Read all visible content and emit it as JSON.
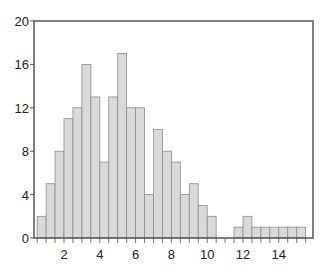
{
  "chart_data": {
    "type": "bar",
    "subtype": "histogram",
    "title": "",
    "xlabel": "",
    "ylabel": "",
    "bin_width": 0.5,
    "bins": [
      {
        "start": 0.5,
        "end": 1.0,
        "count": 2
      },
      {
        "start": 1.0,
        "end": 1.5,
        "count": 5
      },
      {
        "start": 1.5,
        "end": 2.0,
        "count": 8
      },
      {
        "start": 2.0,
        "end": 2.5,
        "count": 11
      },
      {
        "start": 2.5,
        "end": 3.0,
        "count": 12
      },
      {
        "start": 3.0,
        "end": 3.5,
        "count": 16
      },
      {
        "start": 3.5,
        "end": 4.0,
        "count": 13
      },
      {
        "start": 4.0,
        "end": 4.5,
        "count": 7
      },
      {
        "start": 4.5,
        "end": 5.0,
        "count": 13
      },
      {
        "start": 5.0,
        "end": 5.5,
        "count": 17
      },
      {
        "start": 5.5,
        "end": 6.0,
        "count": 12
      },
      {
        "start": 6.0,
        "end": 6.5,
        "count": 12
      },
      {
        "start": 6.5,
        "end": 7.0,
        "count": 4
      },
      {
        "start": 7.0,
        "end": 7.5,
        "count": 10
      },
      {
        "start": 7.5,
        "end": 8.0,
        "count": 8
      },
      {
        "start": 8.0,
        "end": 8.5,
        "count": 7
      },
      {
        "start": 8.5,
        "end": 9.0,
        "count": 4
      },
      {
        "start": 9.0,
        "end": 9.5,
        "count": 5
      },
      {
        "start": 9.5,
        "end": 10.0,
        "count": 3
      },
      {
        "start": 10.0,
        "end": 10.5,
        "count": 2
      },
      {
        "start": 10.5,
        "end": 11.0,
        "count": 0
      },
      {
        "start": 11.0,
        "end": 11.5,
        "count": 0
      },
      {
        "start": 11.5,
        "end": 12.0,
        "count": 1
      },
      {
        "start": 12.0,
        "end": 12.5,
        "count": 2
      },
      {
        "start": 12.5,
        "end": 13.0,
        "count": 1
      },
      {
        "start": 13.0,
        "end": 13.5,
        "count": 1
      },
      {
        "start": 13.5,
        "end": 14.0,
        "count": 1
      },
      {
        "start": 14.0,
        "end": 14.5,
        "count": 1
      },
      {
        "start": 14.5,
        "end": 15.0,
        "count": 1
      },
      {
        "start": 15.0,
        "end": 15.5,
        "count": 1
      }
    ],
    "xlim": [
      0,
      15.7
    ],
    "ylim": [
      0,
      20
    ],
    "x_ticks": [
      2,
      4,
      6,
      8,
      10,
      12,
      14
    ],
    "x_minor_tick_step": 0.5,
    "y_ticks": [
      0,
      4,
      8,
      12,
      16,
      20
    ],
    "grid": false,
    "legend": null,
    "colors": {
      "bar_fill": "#d9d9d9",
      "bar_edge": "#8c8c8c",
      "frame": "#555555",
      "text": "#222222"
    }
  }
}
